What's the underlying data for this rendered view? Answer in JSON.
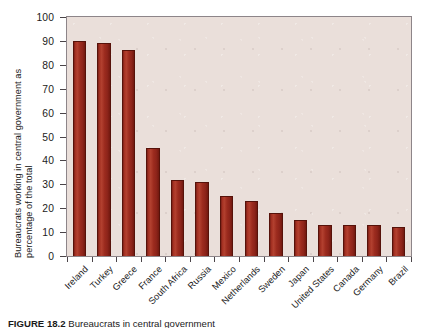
{
  "chart_data": {
    "type": "bar",
    "title": "",
    "xlabel": "",
    "ylabel_line1": "Bureaucrats working in central government as",
    "ylabel_line2": "percentage of the total",
    "ylim": [
      0,
      100
    ],
    "yticks": [
      0,
      10,
      20,
      30,
      40,
      50,
      60,
      70,
      80,
      90,
      100
    ],
    "grid": false,
    "legend": "none",
    "bar_color": "#9c2b1e",
    "plot_background": "#eadfda",
    "categories": [
      "Ireland",
      "Turkey",
      "Greece",
      "France",
      "South Africa",
      "Russia",
      "Mexico",
      "Netherlands",
      "Sweden",
      "Japan",
      "United States",
      "Canada",
      "Germany",
      "Brazil"
    ],
    "values": [
      90,
      89,
      86,
      45,
      32,
      31,
      25,
      23,
      18,
      15,
      13,
      13,
      13,
      12
    ]
  },
  "caption": {
    "figure_number": "FIGURE 18.2",
    "text": "Bureaucrats in central government"
  }
}
